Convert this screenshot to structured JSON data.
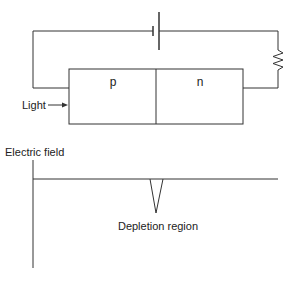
{
  "diagram": {
    "circuit": {
      "components": {
        "battery": "battery-symbol",
        "resistor": "resistor-symbol",
        "junction": "p-n junction"
      },
      "junction_labels": {
        "p": "p",
        "n": "n"
      },
      "light_label": "Light"
    },
    "field_plot": {
      "ylabel": "Electric field",
      "annotation": "Depletion region"
    },
    "colors": {
      "line": "#333333",
      "text": "#222222",
      "background": "#ffffff"
    }
  }
}
